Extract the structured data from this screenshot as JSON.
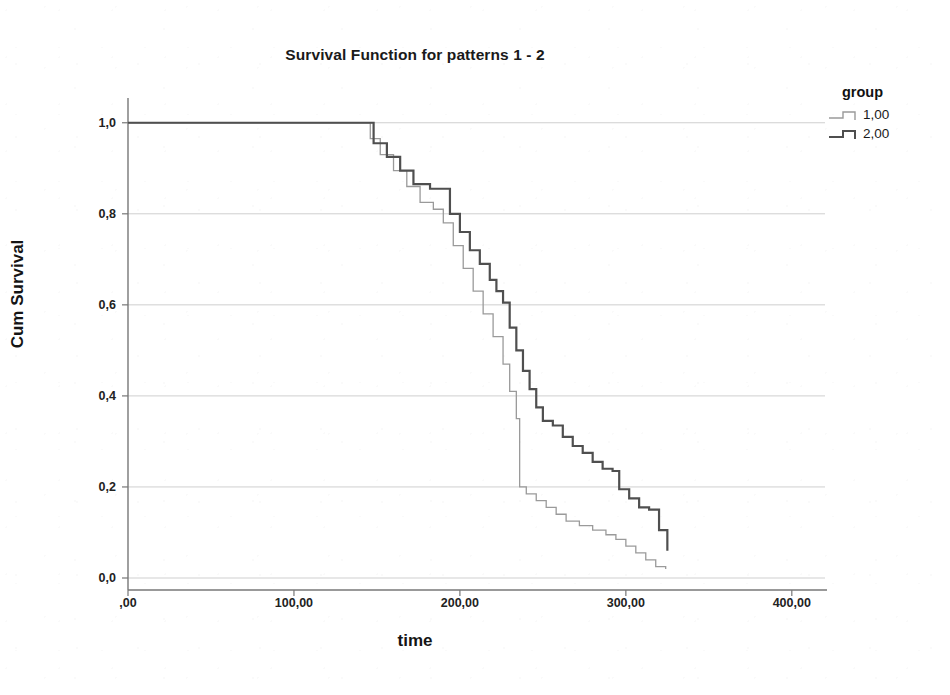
{
  "chart_data": {
    "type": "line",
    "title": "Survival Function for patterns 1 - 2",
    "xlabel": "time",
    "ylabel": "Cum Survival",
    "xlim": [
      0,
      420
    ],
    "ylim": [
      0,
      1.05
    ],
    "grid": true,
    "legend_position": "right",
    "legend_title": "group",
    "xticks": [
      0,
      100,
      200,
      300,
      400
    ],
    "xtick_labels": [
      ",00",
      "100,00",
      "200,00",
      "300,00",
      "400,00"
    ],
    "yticks": [
      0.0,
      0.2,
      0.4,
      0.6,
      0.8,
      1.0
    ],
    "ytick_labels": [
      "0,0",
      "0,2",
      "0,4",
      "0,6",
      "0,8",
      "1,0"
    ],
    "series": [
      {
        "name": "1,00",
        "color": "#9a9a9a",
        "width": 1.3,
        "step": "post",
        "x": [
          0,
          140,
          146,
          152,
          160,
          168,
          176,
          184,
          190,
          196,
          202,
          208,
          214,
          220,
          226,
          230,
          234,
          236,
          240,
          246,
          252,
          258,
          264,
          272,
          280,
          288,
          294,
          300,
          306,
          312,
          318,
          324
        ],
        "y": [
          1.0,
          1.0,
          0.965,
          0.93,
          0.895,
          0.86,
          0.825,
          0.81,
          0.78,
          0.73,
          0.68,
          0.63,
          0.58,
          0.53,
          0.47,
          0.41,
          0.35,
          0.2,
          0.185,
          0.17,
          0.155,
          0.14,
          0.125,
          0.115,
          0.105,
          0.095,
          0.085,
          0.07,
          0.055,
          0.04,
          0.025,
          0.02
        ]
      },
      {
        "name": "2,00",
        "color": "#4f4f4f",
        "width": 2.2,
        "step": "post",
        "x": [
          0,
          140,
          148,
          156,
          164,
          172,
          182,
          194,
          200,
          206,
          212,
          218,
          222,
          226,
          230,
          234,
          238,
          242,
          246,
          250,
          256,
          262,
          268,
          274,
          280,
          286,
          292,
          296,
          302,
          308,
          314,
          320,
          325
        ],
        "y": [
          1.0,
          1.0,
          0.955,
          0.925,
          0.895,
          0.865,
          0.855,
          0.8,
          0.76,
          0.72,
          0.69,
          0.655,
          0.63,
          0.605,
          0.55,
          0.5,
          0.455,
          0.415,
          0.375,
          0.345,
          0.335,
          0.31,
          0.29,
          0.275,
          0.255,
          0.24,
          0.235,
          0.195,
          0.175,
          0.155,
          0.15,
          0.105,
          0.06
        ]
      }
    ],
    "axis_color": "#777777",
    "grid_color": "#cfcfcf",
    "background": "#ffffff"
  },
  "legend": {
    "title": "group",
    "items": [
      {
        "label": "1,00"
      },
      {
        "label": "2,00"
      }
    ]
  }
}
